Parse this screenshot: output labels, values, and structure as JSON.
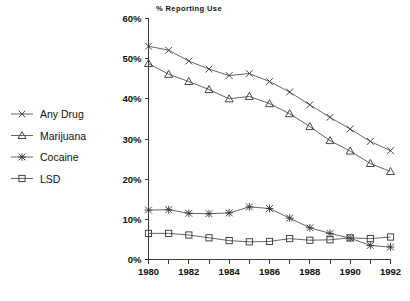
{
  "chart_data": {
    "type": "line",
    "title": "% Reporting Use",
    "xlabel": "",
    "ylabel": "",
    "x": [
      1980,
      1981,
      1982,
      1983,
      1984,
      1985,
      1986,
      1987,
      1988,
      1989,
      1990,
      1991,
      1992
    ],
    "xlim": [
      1980,
      1992
    ],
    "ylim": [
      0,
      60
    ],
    "yticks": [
      0,
      10,
      20,
      30,
      40,
      50,
      60
    ],
    "ytick_labels": [
      "0%",
      "10%",
      "20%",
      "30%",
      "40%",
      "50%",
      "60%"
    ],
    "xticks": [
      1980,
      1981,
      1982,
      1983,
      1984,
      1985,
      1986,
      1987,
      1988,
      1989,
      1990,
      1991,
      1992
    ],
    "xtick_labels": [
      "1980",
      "",
      "1982",
      "",
      "1984",
      "",
      "1986",
      "",
      "1988",
      "",
      "1990",
      "",
      "1992"
    ],
    "grid": false,
    "legend_position": "left-outside",
    "series": [
      {
        "name": "Any Drug",
        "marker": "x",
        "values": [
          53.1,
          52.1,
          49.4,
          47.4,
          45.8,
          46.3,
          44.3,
          41.7,
          38.5,
          35.4,
          32.5,
          29.4,
          27.1
        ]
      },
      {
        "name": "Marijuana",
        "marker": "triangle",
        "values": [
          48.8,
          46.1,
          44.3,
          42.3,
          40.0,
          40.6,
          38.8,
          36.3,
          33.1,
          29.6,
          27.0,
          23.9,
          21.9
        ]
      },
      {
        "name": "Cocaine",
        "marker": "asterisk",
        "values": [
          12.3,
          12.4,
          11.5,
          11.4,
          11.6,
          13.1,
          12.7,
          10.3,
          7.9,
          6.5,
          5.3,
          3.5,
          3.1
        ]
      },
      {
        "name": "LSD",
        "marker": "square",
        "values": [
          6.5,
          6.5,
          6.1,
          5.4,
          4.7,
          4.4,
          4.5,
          5.2,
          4.8,
          4.9,
          5.4,
          5.2,
          5.6
        ]
      }
    ]
  },
  "legend": {
    "items": [
      {
        "label": "Any Drug"
      },
      {
        "label": "Marijuana"
      },
      {
        "label": "Cocaine"
      },
      {
        "label": "LSD"
      }
    ]
  }
}
